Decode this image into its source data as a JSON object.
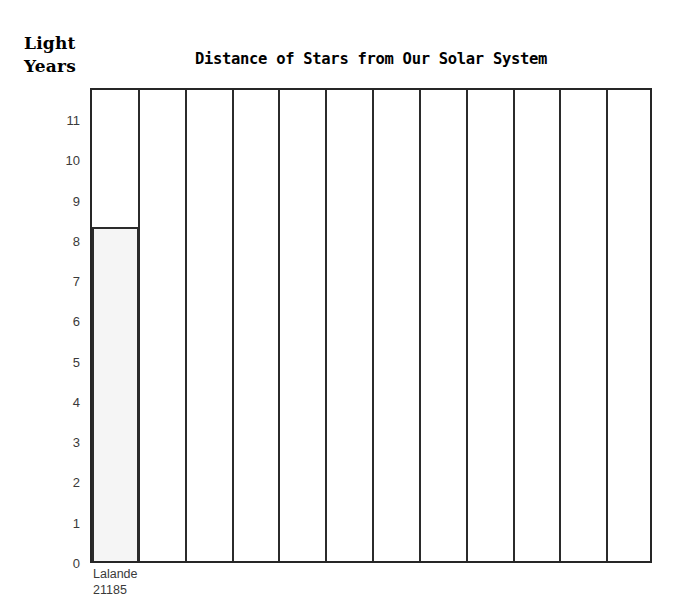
{
  "axis_title": {
    "line1": "Light",
    "line2": "Years"
  },
  "chart_data": {
    "type": "bar",
    "title": "Distance of Stars from Our Solar System",
    "xlabel": "",
    "ylabel": "Light Years",
    "ylim": [
      0,
      11.8
    ],
    "grid": false,
    "legend": "none",
    "column_count": 12,
    "yticks": [
      "11",
      "10",
      "9",
      "8",
      "7",
      "6",
      "5",
      "4",
      "3",
      "2",
      "1",
      "0"
    ],
    "ytick_values": [
      11,
      10,
      9,
      8,
      7,
      6,
      5,
      4,
      3,
      2,
      1,
      0
    ],
    "categories": [
      "Lalande 21185",
      "",
      "",
      "",
      "",
      "",
      "",
      "",
      "",
      "",
      "",
      ""
    ],
    "category_labels": [
      {
        "line1": "Lalande",
        "line2": "21185"
      },
      {
        "line1": "",
        "line2": ""
      },
      {
        "line1": "",
        "line2": ""
      },
      {
        "line1": "",
        "line2": ""
      },
      {
        "line1": "",
        "line2": ""
      },
      {
        "line1": "",
        "line2": ""
      },
      {
        "line1": "",
        "line2": ""
      },
      {
        "line1": "",
        "line2": ""
      },
      {
        "line1": "",
        "line2": ""
      },
      {
        "line1": "",
        "line2": ""
      },
      {
        "line1": "",
        "line2": ""
      },
      {
        "line1": "",
        "line2": ""
      }
    ],
    "values": [
      8.3,
      null,
      null,
      null,
      null,
      null,
      null,
      null,
      null,
      null,
      null,
      null
    ],
    "bar_fill_color": "#f5f5f5",
    "bar_border_color": "#2b2b2b",
    "axis_color": "#262626"
  }
}
